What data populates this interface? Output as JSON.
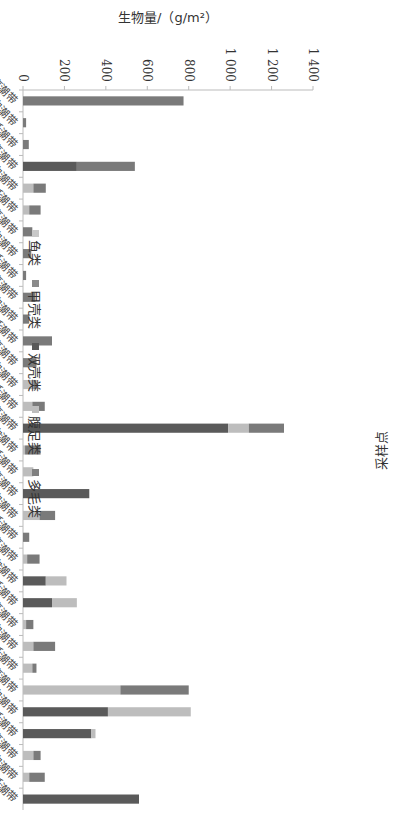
{
  "chart_data": {
    "type": "bar",
    "stacked": true,
    "orientation": "rotated-90",
    "title": "",
    "xlabel": "采样点",
    "ylabel": "生物量/（g/m²）",
    "ylim": [
      0,
      1400
    ],
    "yticks": [
      "0",
      "200",
      "400",
      "600",
      "800",
      "1 000",
      "1 200",
      "1 400"
    ],
    "grid": false,
    "legend_position": "top",
    "categories": [
      "红沙村高潮带",
      "红沙村中潮带",
      "红沙村低潮带",
      "西村高潮带",
      "西村中潮带",
      "西村低潮带",
      "东村高潮带",
      "东村中潮带",
      "东村低潮带",
      "凤凰村高潮带",
      "凤凰村中潮带",
      "凤凰村低潮带",
      "山米村高潮带",
      "山米村中潮带",
      "山米村低潮带",
      "上坊村高潮带",
      "上坊村中潮带",
      "上坊村低潮带",
      "南渡河高潮带",
      "南渡河中潮带",
      "南渡河低潮带",
      "北莱村高潮带",
      "北莱村中潮带",
      "北莱村低潮带",
      "东茂村高潮带",
      "东茂村中潮带",
      "东茂村低潮带",
      "好坑村高潮带",
      "好坑村中潮带",
      "好坑村低潮带",
      "白沙村高潮带",
      "白沙村中潮带",
      "白沙村低潮带"
    ],
    "series": [
      {
        "name": "鱼类",
        "color": "#c4c4c4",
        "values": [
          0,
          0,
          0,
          0,
          0,
          0,
          0,
          0,
          0,
          0,
          0,
          0,
          0,
          0,
          0,
          0,
          0,
          0,
          0,
          0,
          0,
          0,
          0,
          0,
          0,
          0,
          0,
          0,
          0,
          0,
          0,
          0,
          0
        ]
      },
      {
        "name": "甲壳类",
        "color": "#8c8c8c",
        "values": [
          0,
          0,
          0,
          0,
          0,
          0,
          0,
          0,
          0,
          0,
          0,
          0,
          0,
          0,
          0,
          0,
          0,
          0,
          0,
          0,
          0,
          0,
          0,
          0,
          0,
          0,
          0,
          0,
          0,
          0,
          0,
          0,
          0
        ]
      },
      {
        "name": "双壳类",
        "color": "#5a5a5a",
        "values": [
          0,
          0,
          0,
          260,
          0,
          0,
          0,
          0,
          0,
          0,
          0,
          0,
          0,
          0,
          0,
          990,
          0,
          0,
          320,
          0,
          0,
          0,
          110,
          140,
          0,
          0,
          0,
          0,
          410,
          330,
          0,
          0,
          560
        ]
      },
      {
        "name": "腹足类",
        "color": "#bdbdbd",
        "values": [
          0,
          0,
          0,
          0,
          50,
          30,
          0,
          0,
          0,
          0,
          0,
          0,
          0,
          50,
          45,
          100,
          10,
          50,
          0,
          80,
          0,
          20,
          100,
          120,
          15,
          50,
          45,
          470,
          400,
          20,
          50,
          30,
          0
        ]
      },
      {
        "name": "多毛类",
        "color": "#7a7a7a",
        "values": [
          775,
          15,
          28,
          280,
          60,
          55,
          45,
          40,
          15,
          60,
          30,
          140,
          65,
          15,
          60,
          170,
          75,
          0,
          0,
          75,
          30,
          60,
          0,
          0,
          35,
          105,
          20,
          330,
          0,
          0,
          35,
          75,
          0
        ]
      }
    ],
    "totals": [
      775,
      15,
      28,
      540,
      110,
      85,
      45,
      40,
      15,
      60,
      30,
      140,
      65,
      65,
      105,
      1260,
      85,
      50,
      320,
      155,
      30,
      80,
      210,
      260,
      50,
      155,
      65,
      800,
      810,
      350,
      85,
      105,
      560
    ]
  },
  "legend": {
    "items": [
      {
        "label": "鱼类",
        "color": "#c8c8c8"
      },
      {
        "label": "甲壳类",
        "color": "#8a8a8a"
      },
      {
        "label": "双壳类",
        "color": "#5a5a5a"
      },
      {
        "label": "腹足类",
        "color": "#bdbdbd"
      },
      {
        "label": "多毛类",
        "color": "#808080"
      }
    ]
  },
  "axes": {
    "value_axis_title": "生物量/（g/m²）",
    "category_axis_title": "采样点"
  }
}
